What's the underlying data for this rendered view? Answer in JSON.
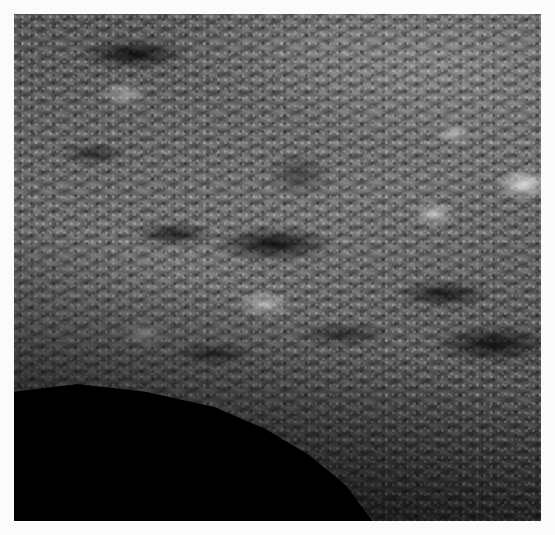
{
  "image": {
    "description": "Grayscale orbital image of a rugged planetary surface with diagonal ridged terrain and a large black shadowed region in the lower-left",
    "frame_color": "#fbfbfb",
    "shadow_color": "#000000"
  }
}
